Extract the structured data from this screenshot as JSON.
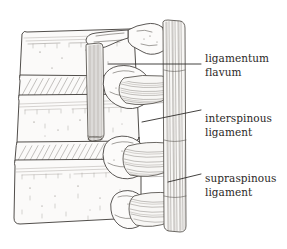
{
  "figure": {
    "kind": "anatomical-line-illustration",
    "background_color": "#ffffff",
    "ink_color": "#3d3a37",
    "label_text_color": "#2b2826"
  },
  "labels": [
    {
      "id": "ligamentum-flavum",
      "line1": "ligamentum",
      "line2": "flavum",
      "leader": "horizontal"
    },
    {
      "id": "interspinous-ligament",
      "line1": "interspinous",
      "line2": "ligament",
      "leader": "diagonal"
    },
    {
      "id": "supraspinous-ligament",
      "line1": "supraspinous",
      "line2": "ligament",
      "leader": "diagonal"
    }
  ]
}
